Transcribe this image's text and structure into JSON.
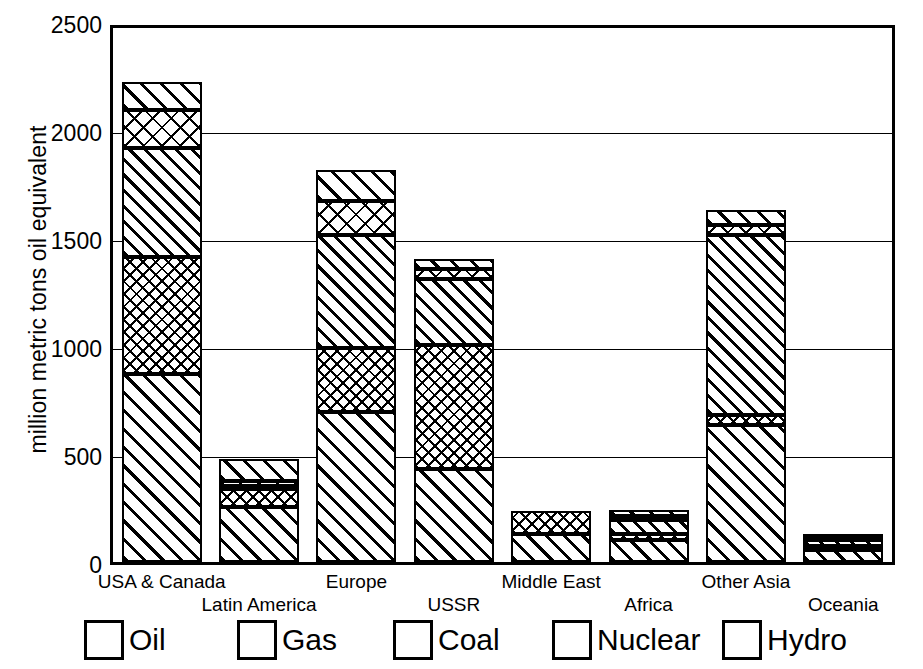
{
  "chart_data": {
    "type": "bar",
    "subtype": "stacked-bar",
    "title": "",
    "xlabel": "",
    "ylabel": "million metric tons oil equivalent",
    "ylim": [
      0,
      2500
    ],
    "yticks": [
      0,
      500,
      1000,
      1500,
      2000,
      2500
    ],
    "grid": true,
    "legend_position": "bottom",
    "categories": [
      "USA & Canada",
      "Latin America",
      "Europe",
      "USSR",
      "Middle East",
      "Africa",
      "Other Asia",
      "Oceania"
    ],
    "series": [
      {
        "name": "Oil",
        "pattern": "diagonal-hatch-wide",
        "values": [
          870,
          255,
          695,
          430,
          130,
          100,
          580,
          55
        ]
      },
      {
        "name": "Gas",
        "pattern": "cross-hatch-fine",
        "values": [
          550,
          75,
          295,
          575,
          105,
          25,
          45,
          20
        ]
      },
      {
        "name": "Coal",
        "pattern": "diagonal-hatch-medium",
        "values": [
          505,
          15,
          1270,
          310,
          0,
          70,
          835,
          30
        ]
      },
      {
        "name": "Nuclear",
        "pattern": "cross-hatch-coarse",
        "values": [
          175,
          20,
          155,
          45,
          0,
          10,
          45,
          5
        ]
      },
      {
        "name": "Hydro",
        "pattern": "diagonal-hatch-wide",
        "values": [
          120,
          100,
          75,
          40,
          0,
          20,
          125,
          10
        ]
      }
    ],
    "totals": [
      2220,
      465,
      1815,
      1400,
      235,
      225,
      1630,
      120
    ],
    "bar_segments_px": {
      "note": "segment heights measured from plot, bottom-up order Oil,Gas,Coal,Nuclear,Hydro",
      "USA & Canada": [
        188,
        117,
        109,
        38,
        28
      ],
      "Latin America": [
        55,
        18,
        3,
        5,
        22
      ],
      "Europe": [
        150,
        64,
        113,
        34,
        31
      ],
      "USSR": [
        93,
        124,
        66,
        10,
        10
      ],
      "Middle East": [
        28,
        23,
        0,
        0,
        0
      ],
      "Africa": [
        22,
        6,
        14,
        4,
        6
      ],
      "Other Asia": [
        137,
        10,
        180,
        10,
        15
      ],
      "Oceania": [
        12,
        4,
        6,
        2,
        2
      ]
    }
  },
  "axis": {
    "ytitle": "million metric tons oil equivalent",
    "yticks": [
      "2500",
      "2000",
      "1500",
      "1000",
      "500",
      "0"
    ]
  },
  "xlabels": [
    {
      "text": "USA & Canada",
      "row": "a"
    },
    {
      "text": "Latin America",
      "row": "b"
    },
    {
      "text": "Europe",
      "row": "a"
    },
    {
      "text": "USSR",
      "row": "b"
    },
    {
      "text": "Middle East",
      "row": "a"
    },
    {
      "text": "Africa",
      "row": "b"
    },
    {
      "text": "Other Asia",
      "row": "a"
    },
    {
      "text": "Oceania",
      "row": "b"
    }
  ],
  "legend": {
    "items": [
      {
        "label": "Oil",
        "pattern": "p-oil"
      },
      {
        "label": "Gas",
        "pattern": "p-gas"
      },
      {
        "label": "Coal",
        "pattern": "p-coal"
      },
      {
        "label": "Nuclear",
        "pattern": "p-nuclear"
      },
      {
        "label": "Hydro",
        "pattern": "p-hydro"
      }
    ]
  },
  "colors": {
    "ink": "#000000",
    "background": "#ffffff"
  }
}
